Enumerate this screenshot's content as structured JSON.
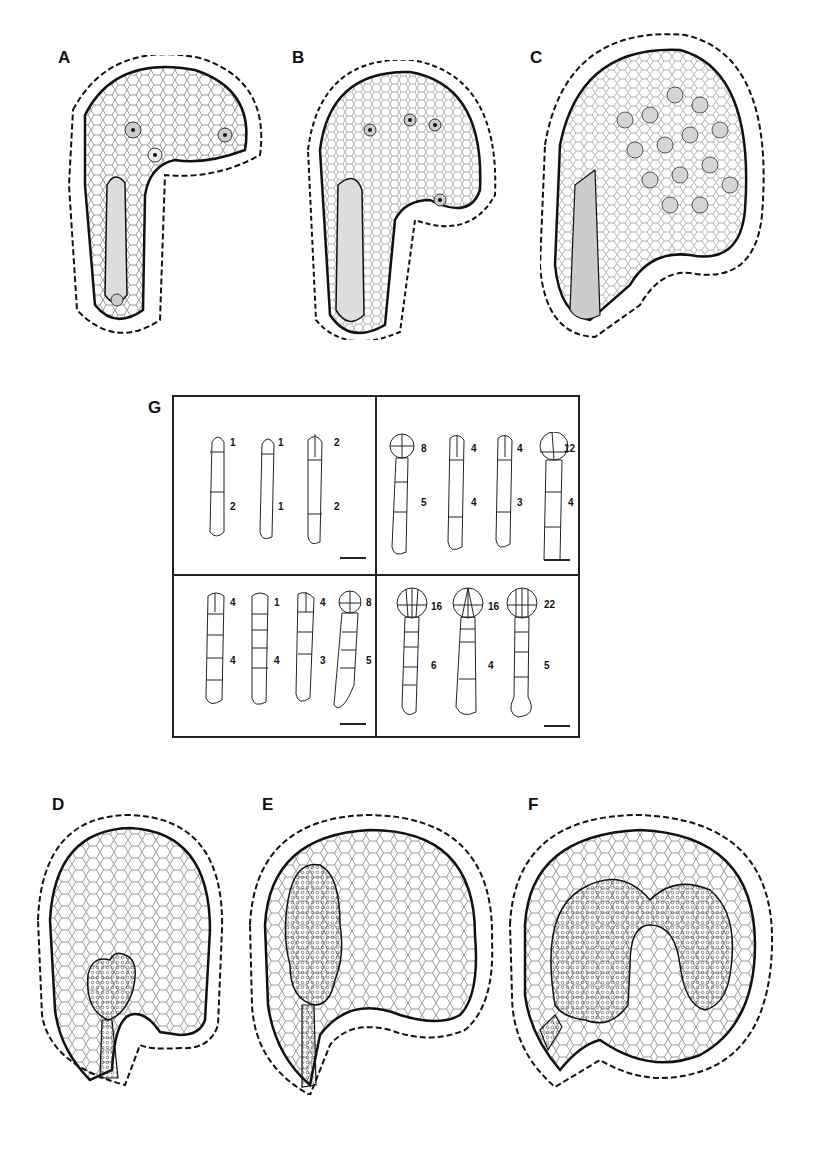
{
  "figure": {
    "panels": {
      "A": {
        "label": "A"
      },
      "B": {
        "label": "B"
      },
      "C": {
        "label": "C"
      },
      "D": {
        "label": "D"
      },
      "E": {
        "label": "E"
      },
      "F": {
        "label": "F"
      },
      "G": {
        "label": "G"
      }
    },
    "panel_g": {
      "quadrants": [
        {
          "name": "top-left",
          "embryos": [
            {
              "head": "1",
              "body": "2"
            },
            {
              "head": "1",
              "body": "1"
            },
            {
              "head": "2",
              "body": "2"
            }
          ]
        },
        {
          "name": "top-right",
          "embryos": [
            {
              "head": "8",
              "body": "5"
            },
            {
              "head": "4",
              "body": "4"
            },
            {
              "head": "4",
              "body": "3"
            },
            {
              "head": "12",
              "body": "4"
            }
          ]
        },
        {
          "name": "bottom-left",
          "embryos": [
            {
              "head": "4",
              "body": "4"
            },
            {
              "head": "1",
              "body": "4"
            },
            {
              "head": "4",
              "body": "3"
            },
            {
              "head": "8",
              "body": "5"
            }
          ]
        },
        {
          "name": "bottom-right",
          "embryos": [
            {
              "head": "16",
              "body": "6"
            },
            {
              "head": "16",
              "body": "4"
            },
            {
              "head": "22",
              "body": "5"
            }
          ]
        }
      ]
    }
  },
  "colors": {
    "ink": "#222222",
    "stipple": "#9a9a9a",
    "background": "#ffffff"
  }
}
